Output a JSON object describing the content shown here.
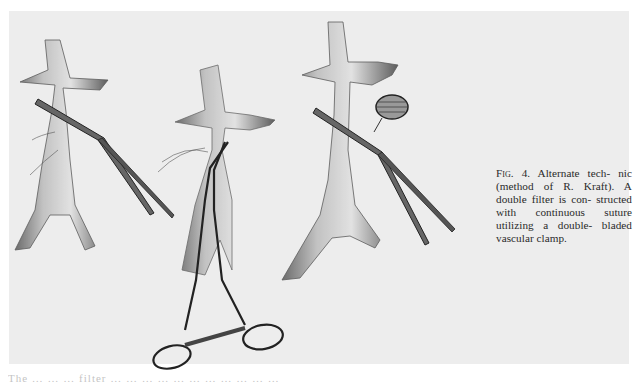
{
  "figure": {
    "label": "Fig. 4.",
    "caption_lines": [
      "Alternate tech-",
      "nic (method of R. Kraft).",
      "A double filter is con-",
      "structed with continuous",
      "suture utilizing a double-",
      "bladed vascular clamp."
    ],
    "panels": [
      {
        "id": "left",
        "description": "Vessel with renal branches, straight vascular clamp applied diagonally, sutures at side"
      },
      {
        "id": "middle",
        "description": "Vessel with double-bladed clamp (ring handles with ratchet) and sutures"
      },
      {
        "id": "right",
        "description": "Vessel with clamp applied diagonally and a round mesh filter beside it"
      }
    ]
  },
  "footer": {
    "truncated_text": "The … … … filter … … … … … … … … … … …"
  }
}
